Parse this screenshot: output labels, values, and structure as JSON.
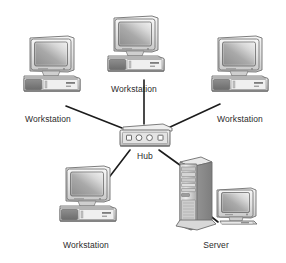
{
  "diagram": {
    "background_color": "#ffffff",
    "line_color": "#1c1c1c",
    "label_color": "#2b2b2b",
    "nodes": [
      {
        "id": "workstation-top",
        "label": "Workstation",
        "type": "desktop-computer",
        "x": 134,
        "y": 48,
        "label_x": 134,
        "label_y": 89
      },
      {
        "id": "workstation-left",
        "label": "Workstation",
        "type": "desktop-computer",
        "x": 50,
        "y": 68,
        "label_x": 49,
        "label_y": 119
      },
      {
        "id": "workstation-right",
        "label": "Workstation",
        "type": "desktop-computer",
        "x": 238,
        "y": 68,
        "label_x": 238,
        "label_y": 119
      },
      {
        "id": "workstation-bottom-left",
        "label": "Workstation",
        "type": "desktop-computer",
        "x": 86,
        "y": 200,
        "label_x": 86,
        "label_y": 245
      },
      {
        "id": "hub",
        "label": "Hub",
        "type": "network-hub",
        "x": 143,
        "y": 136,
        "label_x": 143,
        "label_y": 157,
        "ports": 4,
        "port_shapes": [
          "square",
          "circle",
          "circle",
          "square"
        ]
      },
      {
        "id": "server",
        "label": "Server",
        "type": "tower-server",
        "x": 215,
        "y": 200,
        "label_x": 215,
        "label_y": 245
      }
    ],
    "links": [
      {
        "from": "hub",
        "to": "workstation-top",
        "x1": 144,
        "y1": 124,
        "x2": 144,
        "y2": 82
      },
      {
        "from": "hub",
        "to": "workstation-left",
        "x1": 122,
        "y1": 127,
        "x2": 68,
        "y2": 106
      },
      {
        "from": "hub",
        "to": "workstation-right",
        "x1": 168,
        "y1": 127,
        "x2": 218,
        "y2": 106
      },
      {
        "from": "hub",
        "to": "workstation-bottom-left",
        "x1": 130,
        "y1": 150,
        "x2": 105,
        "y2": 185
      },
      {
        "from": "hub",
        "to": "server",
        "x1": 158,
        "y1": 150,
        "x2": 183,
        "y2": 170
      },
      {
        "from": "server-tower",
        "to": "server-monitor",
        "x1": 199,
        "y1": 208,
        "x2": 216,
        "y2": 225
      }
    ]
  }
}
